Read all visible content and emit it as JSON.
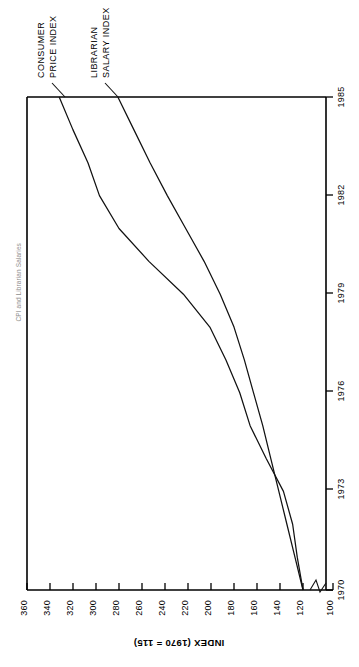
{
  "figure": {
    "edge_caption": "CPI and Librarian Salaries",
    "orientation_note": "rotated-90"
  },
  "axes": {
    "value_axis_title": "INDEX (1970 = 115)",
    "value_ticks": [
      "360",
      "340",
      "320",
      "300",
      "280",
      "260",
      "240",
      "220",
      "200",
      "180",
      "160",
      "140",
      "120",
      "100"
    ],
    "time_ticks": [
      "1985",
      "1982",
      "1979",
      "1976",
      "1973",
      "1970"
    ],
    "has_axis_break": true,
    "break_between": [
      "120",
      "100"
    ]
  },
  "legend": {
    "items": [
      {
        "line1": "CONSUMER",
        "line2": "PRICE INDEX"
      },
      {
        "line1": "LIBRARIAN",
        "line2": "SALARY INDEX"
      }
    ]
  },
  "chart_data": {
    "type": "line",
    "title": "CPI and Librarian Salaries",
    "xlabel": "",
    "ylabel": "INDEX (1970 = 115)",
    "x": [
      1970,
      1971,
      1972,
      1973,
      1974,
      1975,
      1976,
      1977,
      1978,
      1979,
      1980,
      1981,
      1982,
      1983,
      1984,
      1985
    ],
    "xlim": [
      1970,
      1985
    ],
    "ylim": [
      100,
      360
    ],
    "xticks": [
      1970,
      1973,
      1976,
      1979,
      1982,
      1985
    ],
    "yticks": [
      100,
      120,
      140,
      160,
      180,
      200,
      220,
      240,
      260,
      280,
      300,
      320,
      340,
      360
    ],
    "grid": false,
    "legend_position": "top-inside",
    "series": [
      {
        "name": "CONSUMER PRICE INDEX",
        "values": [
          120,
          125,
          129,
          137,
          152,
          166,
          175,
          187,
          201,
          224,
          254,
          280,
          297,
          307,
          320,
          332
        ]
      },
      {
        "name": "LIBRARIAN SALARY INDEX",
        "values": [
          120,
          127,
          134,
          141,
          148,
          155,
          163,
          171,
          180,
          192,
          206,
          222,
          238,
          253,
          267,
          281
        ]
      }
    ]
  }
}
